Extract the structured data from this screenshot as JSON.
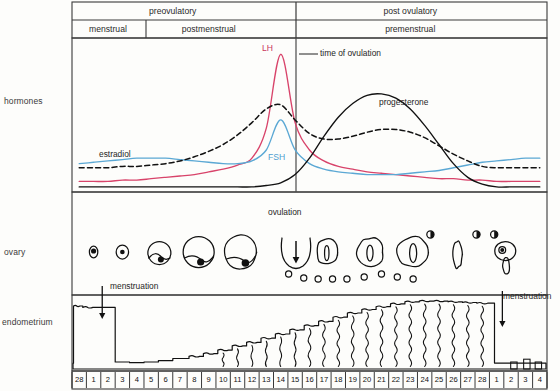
{
  "figure": {
    "geometry": {
      "plot_left": 72,
      "plot_right": 547,
      "header_top": 2,
      "header_mid": 20,
      "header_bottom": 38,
      "hormone_top": 38,
      "hormone_bottom": 192,
      "ovary_top": 192,
      "ovary_bottom": 295,
      "endo_top": 295,
      "endo_bottom": 371,
      "axis_top": 371,
      "axis_bottom": 389,
      "div_phase": 296,
      "div_menstrual": 146,
      "ovulation_x": 296
    },
    "colors": {
      "lh": "#d8436a",
      "fsh": "#5ba8d4",
      "estradiol": "#111111",
      "progesterone": "#111111",
      "frame": "#3a3a3a",
      "ink": "#111111"
    }
  },
  "header": {
    "upper_phases": [
      {
        "label": "preovulatory",
        "from_day": 0,
        "to_day": 14
      },
      {
        "label": "post ovulatory",
        "from_day": 14,
        "to_day": 33
      }
    ],
    "lower_phases": [
      {
        "label": "menstrual",
        "from_day": 0,
        "to_day": 5
      },
      {
        "label": "postmenstrual",
        "from_day": 5,
        "to_day": 14
      },
      {
        "label": "premenstrual",
        "from_day": 14,
        "to_day": 33
      }
    ]
  },
  "row_labels": {
    "hormones": "hormones",
    "ovary": "ovary",
    "endometrium": "endometrium"
  },
  "annotations": {
    "lh": "LH",
    "fsh": "FSH",
    "estradiol": "estradiol",
    "progesterone": "progesterone",
    "time_of_ovulation": "time of ovulation",
    "ovulation": "ovulation",
    "menstruation_left": "menstruation",
    "menstruation_right": "menstruation"
  },
  "axis": {
    "label": "day of cycle",
    "days": [
      "28",
      "1",
      "2",
      "3",
      "4",
      "5",
      "6",
      "7",
      "8",
      "9",
      "10",
      "11",
      "12",
      "13",
      "14",
      "15",
      "16",
      "17",
      "18",
      "19",
      "20",
      "21",
      "22",
      "23",
      "24",
      "25",
      "26",
      "27",
      "28",
      "1",
      "2",
      "3",
      "4"
    ]
  },
  "chart_data": {
    "type": "line",
    "xlabel": "day of cycle",
    "ylabel": "relative hormone level",
    "x": [
      0,
      1,
      2,
      3,
      4,
      5,
      6,
      7,
      8,
      9,
      10,
      11,
      12,
      13,
      14,
      15,
      16,
      17,
      18,
      19,
      20,
      21,
      22,
      23,
      24,
      25,
      26,
      27,
      28,
      29,
      30,
      31,
      32
    ],
    "xtick_labels": [
      "28",
      "1",
      "2",
      "3",
      "4",
      "5",
      "6",
      "7",
      "8",
      "9",
      "10",
      "11",
      "12",
      "13",
      "14",
      "15",
      "16",
      "17",
      "18",
      "19",
      "20",
      "21",
      "22",
      "23",
      "24",
      "25",
      "26",
      "27",
      "28",
      "1",
      "2",
      "3",
      "4"
    ],
    "grid": false,
    "legend": "inline-labels",
    "annotations": [
      {
        "text": "time of ovulation",
        "x": 14,
        "kind": "vertical-line"
      },
      {
        "text": "ovulation",
        "x": 14,
        "kind": "ovary-event"
      },
      {
        "text": "menstruation",
        "x": 2,
        "kind": "endometrium-event"
      },
      {
        "text": "menstruation",
        "x": 30,
        "kind": "endometrium-event"
      }
    ],
    "series": [
      {
        "name": "LH",
        "color": "#d8436a",
        "style": "solid",
        "values": [
          0.07,
          0.07,
          0.07,
          0.08,
          0.08,
          0.09,
          0.1,
          0.11,
          0.12,
          0.14,
          0.16,
          0.19,
          0.24,
          0.46,
          1.0,
          0.5,
          0.3,
          0.22,
          0.18,
          0.16,
          0.14,
          0.13,
          0.12,
          0.11,
          0.1,
          0.09,
          0.09,
          0.08,
          0.08,
          0.07,
          0.07,
          0.07,
          0.07
        ]
      },
      {
        "name": "FSH",
        "color": "#5ba8d4",
        "style": "solid",
        "values": [
          0.2,
          0.21,
          0.22,
          0.23,
          0.24,
          0.24,
          0.24,
          0.23,
          0.22,
          0.21,
          0.2,
          0.2,
          0.22,
          0.3,
          0.52,
          0.3,
          0.2,
          0.16,
          0.14,
          0.13,
          0.12,
          0.12,
          0.12,
          0.13,
          0.14,
          0.15,
          0.17,
          0.19,
          0.21,
          0.22,
          0.23,
          0.24,
          0.24
        ]
      },
      {
        "name": "estradiol",
        "color": "#111111",
        "style": "dashed",
        "values": [
          0.17,
          0.17,
          0.17,
          0.18,
          0.18,
          0.19,
          0.2,
          0.22,
          0.25,
          0.29,
          0.34,
          0.41,
          0.5,
          0.6,
          0.63,
          0.52,
          0.42,
          0.38,
          0.38,
          0.4,
          0.43,
          0.45,
          0.45,
          0.43,
          0.39,
          0.33,
          0.27,
          0.22,
          0.18,
          0.17,
          0.17,
          0.17,
          0.17
        ]
      },
      {
        "name": "progesterone",
        "color": "#111111",
        "style": "solid",
        "values": [
          0.03,
          0.03,
          0.03,
          0.03,
          0.03,
          0.03,
          0.03,
          0.03,
          0.03,
          0.03,
          0.03,
          0.03,
          0.03,
          0.04,
          0.06,
          0.12,
          0.24,
          0.4,
          0.54,
          0.64,
          0.7,
          0.71,
          0.68,
          0.6,
          0.48,
          0.34,
          0.2,
          0.1,
          0.05,
          0.03,
          0.03,
          0.03,
          0.03
        ]
      }
    ],
    "ovary_stages": [
      {
        "day": 1,
        "stage": "primordial follicle"
      },
      {
        "day": 3,
        "stage": "primary follicle"
      },
      {
        "day": 5.5,
        "stage": "early antral follicle"
      },
      {
        "day": 8,
        "stage": "antral follicle"
      },
      {
        "day": 11,
        "stage": "mature graafian follicle"
      },
      {
        "day": 14,
        "stage": "ovulation / ruptured follicle"
      },
      {
        "day": 17,
        "stage": "early corpus luteum"
      },
      {
        "day": 20,
        "stage": "corpus luteum"
      },
      {
        "day": 23,
        "stage": "mature corpus luteum"
      },
      {
        "day": 26,
        "stage": "regressing corpus luteum"
      },
      {
        "day": 29,
        "stage": "corpus albicans / new follicle"
      }
    ],
    "endometrium_thickness": [
      {
        "day": 0,
        "value": 0.92
      },
      {
        "day": 1,
        "value": 0.9
      },
      {
        "day": 2,
        "value": 0.2
      },
      {
        "day": 3,
        "value": 0.1
      },
      {
        "day": 4,
        "value": 0.09
      },
      {
        "day": 5,
        "value": 0.1
      },
      {
        "day": 6,
        "value": 0.12
      },
      {
        "day": 7,
        "value": 0.15
      },
      {
        "day": 8,
        "value": 0.18
      },
      {
        "day": 9,
        "value": 0.22
      },
      {
        "day": 10,
        "value": 0.27
      },
      {
        "day": 11,
        "value": 0.33
      },
      {
        "day": 12,
        "value": 0.38
      },
      {
        "day": 13,
        "value": 0.44
      },
      {
        "day": 14,
        "value": 0.5
      },
      {
        "day": 15,
        "value": 0.56
      },
      {
        "day": 16,
        "value": 0.62
      },
      {
        "day": 17,
        "value": 0.68
      },
      {
        "day": 18,
        "value": 0.74
      },
      {
        "day": 19,
        "value": 0.8
      },
      {
        "day": 20,
        "value": 0.85
      },
      {
        "day": 21,
        "value": 0.89
      },
      {
        "day": 22,
        "value": 0.93
      },
      {
        "day": 23,
        "value": 0.96
      },
      {
        "day": 24,
        "value": 0.97
      },
      {
        "day": 25,
        "value": 0.97
      },
      {
        "day": 26,
        "value": 0.96
      },
      {
        "day": 27,
        "value": 0.95
      },
      {
        "day": 28,
        "value": 0.94
      },
      {
        "day": 29,
        "value": 0.3
      },
      {
        "day": 30,
        "value": 0.1
      },
      {
        "day": 31,
        "value": 0.09
      },
      {
        "day": 32,
        "value": 0.1
      }
    ]
  }
}
